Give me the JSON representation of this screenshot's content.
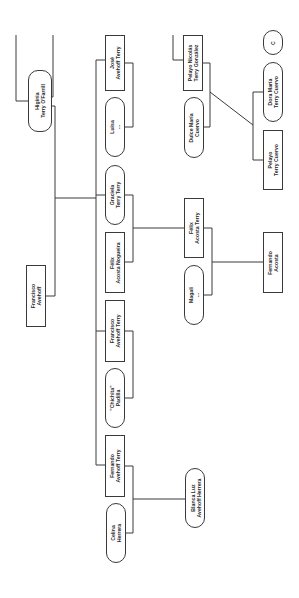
{
  "diagram": {
    "type": "family-tree",
    "orientation": "rotated-90",
    "nodes": [
      {
        "id": "higinia",
        "line1": "Higinia",
        "line2": "Terry O'Farrill",
        "shape": "oval",
        "x": 28,
        "y": 70,
        "w": 24,
        "h": 62
      },
      {
        "id": "francisco_avehoff",
        "line1": "Francisco",
        "line2": "Avehoff",
        "shape": "rect",
        "x": 26,
        "y": 265,
        "w": 20,
        "h": 62
      },
      {
        "id": "jose",
        "line1": "José",
        "line2": "Avehoff Terry",
        "shape": "rect",
        "x": 105,
        "y": 35,
        "w": 20,
        "h": 56
      },
      {
        "id": "luisa",
        "line1": "Luisa",
        "line2": "...",
        "shape": "oval",
        "x": 105,
        "y": 97,
        "w": 20,
        "h": 60
      },
      {
        "id": "graciela",
        "line1": "Graciela",
        "line2": "Terry Terry",
        "shape": "oval",
        "x": 105,
        "y": 165,
        "w": 20,
        "h": 60
      },
      {
        "id": "felix_nogueira",
        "line1": "Félix",
        "line2": "Acosta Nogueira",
        "shape": "rect",
        "x": 105,
        "y": 232,
        "w": 20,
        "h": 61
      },
      {
        "id": "francisco_terry",
        "line1": "Francisco",
        "line2": "Avehoff Terry",
        "shape": "rect",
        "x": 105,
        "y": 300,
        "w": 20,
        "h": 62
      },
      {
        "id": "chichita",
        "line1": "\"Chichita\"",
        "line2": "Padilla",
        "shape": "oval",
        "x": 105,
        "y": 368,
        "w": 20,
        "h": 60
      },
      {
        "id": "fernando_terry",
        "line1": "Fernando",
        "line2": "Avehoff Terry",
        "shape": "rect",
        "x": 105,
        "y": 435,
        "w": 20,
        "h": 62
      },
      {
        "id": "celina",
        "line1": "Celina",
        "line2": "Herrera",
        "shape": "oval",
        "x": 106,
        "y": 503,
        "w": 20,
        "h": 60
      },
      {
        "id": "pelayo_nicolas",
        "line1": "Pelayo Nicolás",
        "line2": "Terry González",
        "shape": "rect",
        "x": 183,
        "y": 35,
        "w": 20,
        "h": 56
      },
      {
        "id": "dulce",
        "line1": "Dulce María",
        "line2": "Cuervo",
        "shape": "oval",
        "x": 184,
        "y": 97,
        "w": 20,
        "h": 61
      },
      {
        "id": "felix_terry",
        "line1": "Félix",
        "line2": "Acosta Terry",
        "shape": "rect",
        "x": 184,
        "y": 198,
        "w": 20,
        "h": 60
      },
      {
        "id": "magali",
        "line1": "Magali",
        "line2": "...",
        "shape": "oval",
        "x": 184,
        "y": 265,
        "w": 20,
        "h": 60
      },
      {
        "id": "blanca",
        "line1": "Blanca Luz",
        "line2": "Avehoff Herrera",
        "shape": "oval",
        "x": 185,
        "y": 468,
        "w": 20,
        "h": 60
      },
      {
        "id": "partial",
        "line1": "C",
        "line2": "",
        "shape": "oval",
        "x": 263,
        "y": 30,
        "w": 20,
        "h": 25
      },
      {
        "id": "dora",
        "line1": "Dora María",
        "line2": "Terry Cuervo",
        "shape": "oval",
        "x": 263,
        "y": 62,
        "w": 20,
        "h": 60
      },
      {
        "id": "pelayo_cuervo",
        "line1": "Pelayo",
        "line2": "Terry Cuervo",
        "shape": "rect",
        "x": 263,
        "y": 130,
        "w": 20,
        "h": 60
      },
      {
        "id": "fernando_acosta",
        "line1": "Fernando",
        "line2": "Acosta",
        "shape": "rect",
        "x": 263,
        "y": 232,
        "w": 20,
        "h": 61
      }
    ],
    "edges": [
      {
        "points": "16,35 16,101 28,101"
      },
      {
        "points": "53,35 53,97 52,97"
      },
      {
        "points": "52,106 55,106 55,296 46,296"
      },
      {
        "points": "55,198 96,198"
      },
      {
        "points": "96,60 96,465 105,465"
      },
      {
        "points": "96,60 105,60"
      },
      {
        "points": "96,195 105,195"
      },
      {
        "points": "96,331 105,331"
      },
      {
        "points": "125,63 133,63 133,127 125,127"
      },
      {
        "points": "125,195 133,195 133,262 125,262"
      },
      {
        "points": "133,228 184,228"
      },
      {
        "points": "125,331 133,331 133,398 125,398"
      },
      {
        "points": "125,466 133,466 133,533 126,533"
      },
      {
        "points": "133,499 185,499"
      },
      {
        "points": "173,35 173,60 183,60"
      },
      {
        "points": "203,63 210,63 210,127 204,127"
      },
      {
        "points": "204,228 212,228 212,295 204,295"
      },
      {
        "points": "212,262 263,262"
      },
      {
        "points": "210,92 253,125"
      },
      {
        "points": "263,92 253,92 253,160 263,160"
      }
    ]
  }
}
